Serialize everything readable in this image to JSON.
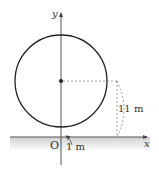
{
  "diagram": {
    "axes": {
      "x_label": "x",
      "y_label": "y",
      "origin_label": "O"
    },
    "circle": {
      "center_marker": "filled-dot"
    },
    "dimensions": {
      "height_label": "11 m",
      "gap_label": "1 m"
    },
    "colors": {
      "stroke": "#222222",
      "dashed": "#888888",
      "ground": "#d9d9d9"
    }
  }
}
